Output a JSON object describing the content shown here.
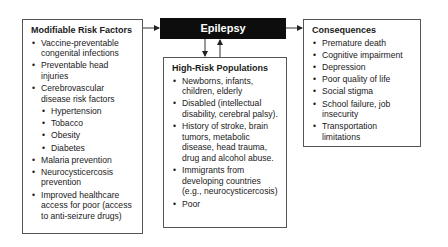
{
  "center": {
    "label": "Epilepsy"
  },
  "modifiable": {
    "title": "Modifiable Risk Factors",
    "items": [
      "Vaccine-preventable congenital infections",
      "Preventable head injuries",
      "Cerebrovascular disease risk factors",
      "Hypertension",
      "Tobacco",
      "Obesity",
      "Diabetes",
      "Malaria prevention",
      "Neurocysticercosis prevention",
      "Improved healthcare access for poor (access to anti-seizure drugs)"
    ]
  },
  "high_risk": {
    "title": "High-Risk Populations",
    "items": [
      "Newborns, infants, children, elderly",
      "Disabled (intellectual disability, cerebral palsy).",
      "History of stroke, brain tumors, metabolic disease, head trauma, drug and alcohol abuse.",
      "Immigrants from developing countries (e.g., neurocysticercosis)",
      "Poor"
    ]
  },
  "consequences": {
    "title": "Consequences",
    "items": [
      "Premature death",
      "Cognitive impairment",
      "Depression",
      "Poor quality of life",
      "Social stigma",
      "School failure, job insecurity",
      "Transportation limitations"
    ]
  }
}
